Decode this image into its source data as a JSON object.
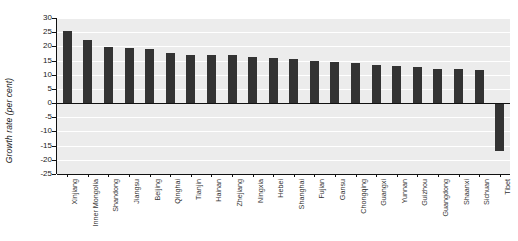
{
  "chart_data": {
    "type": "bar",
    "title": "",
    "xlabel": "",
    "ylabel": "Growth rate (per cent)",
    "ylim": [
      -25,
      30
    ],
    "yticks": [
      30,
      25,
      20,
      15,
      10,
      5,
      0,
      -5,
      -10,
      -15,
      -20,
      -25
    ],
    "ytick_labels": [
      "30",
      "25",
      "20",
      "15",
      "10",
      "5",
      "0",
      "-5",
      "-10",
      "-15",
      "-20",
      "-25"
    ],
    "grid": true,
    "grid_color": "#ffffff",
    "plot_background": "#ececec",
    "bar_color": "#333333",
    "legend": "none",
    "categories": [
      "Xinjiang",
      "Inner Mongolia",
      "Shandong",
      "Jiangsu",
      "Beijing",
      "Qinghai",
      "Tianjin",
      "Hainan",
      "Zhejiang",
      "Ningxia",
      "Hebei",
      "Shanghai",
      "Fujian",
      "Gansu",
      "Chongqing",
      "Guangxi",
      "Yunnan",
      "Guizhou",
      "Guangdong",
      "Shaanxi",
      "Sichuan",
      "Tibet"
    ],
    "values": [
      25.3,
      22.3,
      19.7,
      19.5,
      18.9,
      17.6,
      17.1,
      16.9,
      16.8,
      16.4,
      16.0,
      15.4,
      14.9,
      14.6,
      14.0,
      13.4,
      13.0,
      12.6,
      12.1,
      11.9,
      11.5,
      -17.0
    ]
  }
}
